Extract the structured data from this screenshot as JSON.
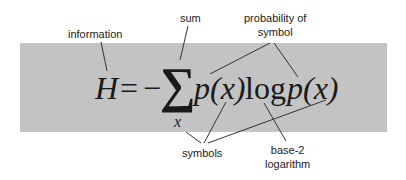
{
  "equation": {
    "lhs": "H",
    "equals": "=",
    "minus": "−",
    "sum_symbol": "∑",
    "sum_index": "x",
    "term1": "p(x)",
    "log": "log",
    "term2": "p(x)"
  },
  "annotations": {
    "information": "information",
    "sum": "sum",
    "probability_line1": "probability of",
    "probability_line2": "symbol",
    "symbols": "symbols",
    "base2_line1": "base-2",
    "base2_line2": "logarithm"
  },
  "colors": {
    "box_background": "#c3c3c3",
    "text": "#222222",
    "leader_lines": "#333333"
  }
}
